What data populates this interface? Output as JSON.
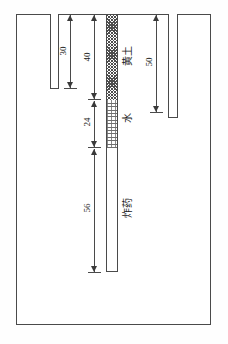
{
  "diagram": {
    "frame": {
      "border_color": "#4a4a4a"
    },
    "dimensions": [
      {
        "id": "left-hole-depth",
        "value": "30"
      },
      {
        "id": "loess-thickness",
        "value": "40"
      },
      {
        "id": "water-thickness",
        "value": "24"
      },
      {
        "id": "explosive-length",
        "value": "56"
      },
      {
        "id": "right-hole-depth",
        "value": "50"
      }
    ],
    "materials": [
      {
        "id": "loess",
        "label": "黄土",
        "pattern": "cross-hatch"
      },
      {
        "id": "water",
        "label": "水",
        "pattern": "stipple"
      },
      {
        "id": "explosive",
        "label": "炸药",
        "pattern": "blank"
      }
    ],
    "colors": {
      "line": "#4a4a4a",
      "hatch": "#4d4d4d",
      "stipple": "#6f6f6f",
      "text": "#1a1a1a",
      "background": "#ffffff"
    }
  }
}
